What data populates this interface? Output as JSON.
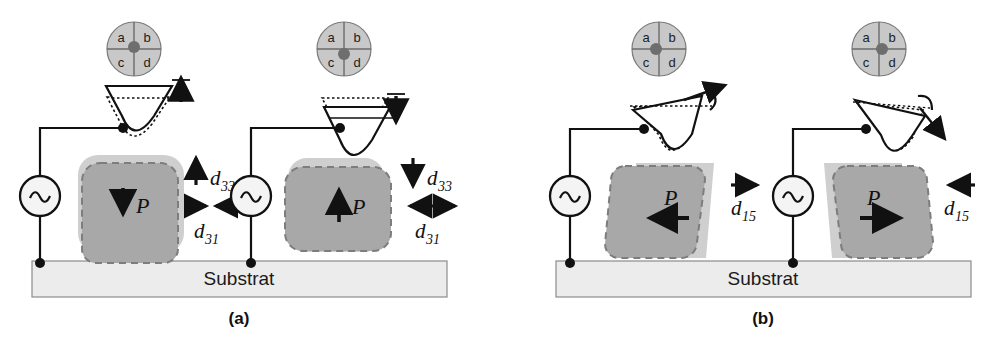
{
  "figure": {
    "background_color": "#ffffff",
    "stroke_color": "#111111",
    "grain_fill_deformed": "#a8a8a8",
    "grain_fill_original": "#cfcfcf",
    "substrate_fill": "#ececec",
    "detector_fill": "#c8c8c8",
    "detector_spot_fill": "#6e6e6e"
  },
  "panels": [
    {
      "id": "a",
      "caption": "(a)",
      "mode_description": "Vertical PFM - out-of-plane polarization",
      "substrate": {
        "label": "Substrat"
      },
      "cases": [
        {
          "id": "a-left",
          "detector": {
            "name": "quadrant-photodetector",
            "quadrants": [
              "a",
              "b",
              "c",
              "d"
            ],
            "spot_position": "center"
          },
          "cantilever": {
            "deflection": "up"
          },
          "source": {
            "type": "ac-voltage-source",
            "symbol": "~"
          },
          "grain": {
            "polarization_label": "P",
            "polarization_direction": "down"
          },
          "coefficients": [
            {
              "symbol": "d",
              "subscript": "33",
              "arrow": "up"
            },
            {
              "symbol": "d",
              "subscript": "31",
              "arrow": "inward"
            }
          ]
        },
        {
          "id": "a-right",
          "detector": {
            "name": "quadrant-photodetector",
            "quadrants": [
              "a",
              "b",
              "c",
              "d"
            ],
            "spot_position": "center-low"
          },
          "cantilever": {
            "deflection": "down"
          },
          "source": {
            "type": "ac-voltage-source",
            "symbol": "~"
          },
          "grain": {
            "polarization_label": "P",
            "polarization_direction": "up"
          },
          "coefficients": [
            {
              "symbol": "d",
              "subscript": "33",
              "arrow": "down"
            },
            {
              "symbol": "d",
              "subscript": "31",
              "arrow": "outward"
            }
          ]
        }
      ]
    },
    {
      "id": "b",
      "caption": "(b)",
      "mode_description": "Lateral PFM - in-plane polarization / torsion",
      "substrate": {
        "label": "Substrat"
      },
      "cases": [
        {
          "id": "b-left",
          "detector": {
            "name": "quadrant-photodetector",
            "quadrants": [
              "a",
              "b",
              "c",
              "d"
            ],
            "spot_position": "center-left"
          },
          "cantilever": {
            "torsion": "counterclockwise"
          },
          "source": {
            "type": "ac-voltage-source",
            "symbol": "~"
          },
          "grain": {
            "polarization_label": "P",
            "polarization_direction": "left",
            "shear": "left"
          },
          "coefficients": [
            {
              "symbol": "d",
              "subscript": "15",
              "arrow": "right"
            }
          ]
        },
        {
          "id": "b-right",
          "detector": {
            "name": "quadrant-photodetector",
            "quadrants": [
              "a",
              "b",
              "c",
              "d"
            ],
            "spot_position": "center-right"
          },
          "cantilever": {
            "torsion": "clockwise"
          },
          "source": {
            "type": "ac-voltage-source",
            "symbol": "~"
          },
          "grain": {
            "polarization_label": "P",
            "polarization_direction": "right",
            "shear": "right"
          },
          "coefficients": [
            {
              "symbol": "d",
              "subscript": "15",
              "arrow": "left"
            }
          ]
        }
      ]
    }
  ]
}
